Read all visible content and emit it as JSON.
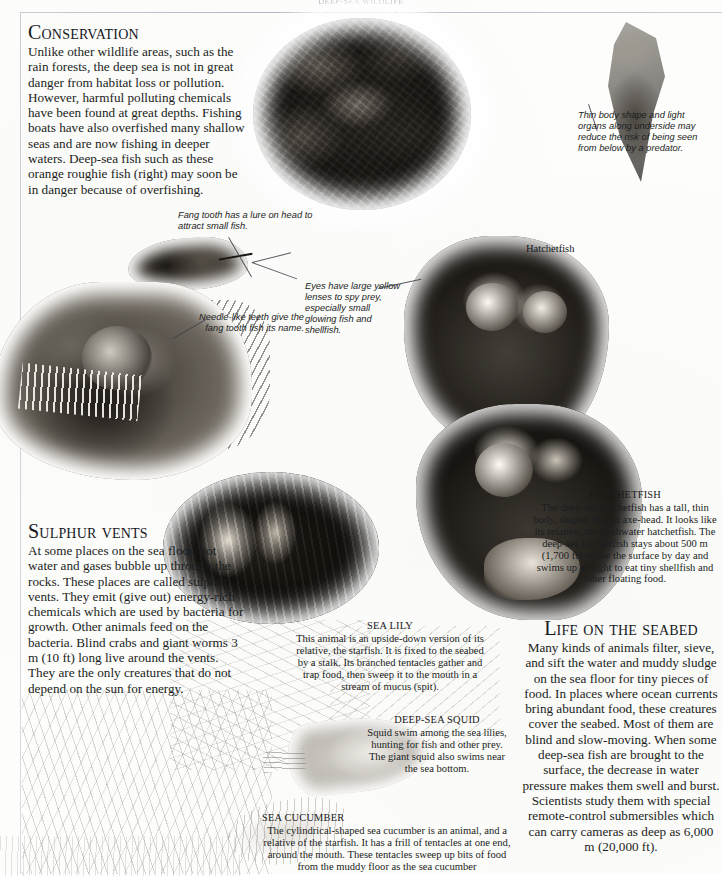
{
  "page": {
    "running_head": "DEEP-SEA WILDLIFE"
  },
  "conservation": {
    "heading": "Conservation",
    "body": "Unlike other wildlife areas, such as the rain forests, the deep sea is not in great danger from habitat loss or pollution. However, harmful polluting chemicals have been found at great depths. Fishing boats have also overfished many shallow seas and are now fishing in deeper waters. Deep-sea fish such as these orange roughie fish (right) may soon be in danger because of overfishing."
  },
  "annotations": {
    "fang_lure": "Fang tooth has a lure on head to attract small fish.",
    "needle_teeth": "Needle-like teeth give the fang tooth fish its name.",
    "eyes": "Eyes have large yellow lenses to spy prey, especially small glowing fish and shellfish.",
    "thin_body": "Thin body shape and light organs along underside may reduce the risk of being seen from below by a predator.",
    "hatchetfish_label": "Hatchetfish"
  },
  "hatchetfish": {
    "heading": "HATCHETFISH",
    "body": "The deep-sea hatchetfish has a tall, thin body, shaped like an axe-head. It looks like its relative, the freshwater hatchetfish. The deep-sea hatchetfish stays about 500 m (1,700 ft) below the surface by day and swims up at night to eat tiny shellfish and other floating food."
  },
  "sulphur_vents": {
    "heading": "Sulphur vents",
    "body": "At some places on the sea floor, hot water and gases bubble up through the rocks. These places are called sulphur vents. They emit (give out) energy-rich chemicals which are used by bacteria for growth. Other animals feed on the bacteria. Blind crabs and giant worms 3 m (10 ft) long live around the vents. They are the only creatures that do not depend on the sun for energy."
  },
  "sea_lily": {
    "heading": "SEA LILY",
    "body": "This animal is an upside-down version of its relative, the starfish. It is fixed to the seabed by a stalk. Its branched tentacles gather and trap food, then sweep it to the mouth in a stream of mucus (spit)."
  },
  "deep_sea_squid": {
    "heading": "DEEP-SEA SQUID",
    "body": "Squid swim among the sea lilies, hunting for fish and other prey. The giant squid also swims near the sea bottom."
  },
  "sea_cucumber": {
    "heading": "SEA CUCUMBER",
    "body": "The cylindrical-shaped sea cucumber is an animal, and a relative of the starfish. It has a frill of tentacles at one end, around the mouth. These tentacles sweep up bits of food from the muddy floor as the sea cucumber"
  },
  "life_on_seabed": {
    "heading": "Life on the seabed",
    "body": "Many kinds of animals filter, sieve, and sift the water and muddy sludge on the sea floor for tiny pieces of food. In places where ocean currents bring abundant food, these creatures cover the seabed. Most of them are blind and slow-moving. When some deep-sea fish are brought to the surface, the decrease in water pressure makes them swell and burst. Scientists study them with special remote-control submersibles which can carry cameras as deep as 6,000 m (20,000 ft)."
  },
  "colors": {
    "ink": "#1b1d21",
    "rule": "#c9ced6",
    "paper": "#fdfdfc"
  }
}
